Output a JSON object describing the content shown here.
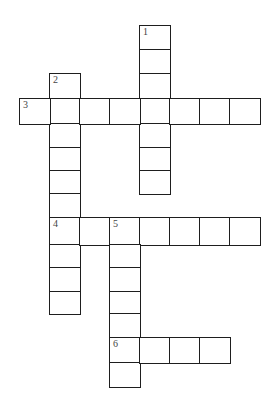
{
  "puzzle": {
    "type": "crossword",
    "cell_width": 30,
    "cell_height": 24,
    "origin_x": 19,
    "origin_y": 25,
    "col_x": [
      19,
      49,
      79,
      109,
      139,
      169,
      199,
      229
    ],
    "row_y": [
      25,
      49,
      73,
      98,
      123,
      147,
      170,
      193,
      217,
      244,
      267,
      291,
      313,
      337,
      362
    ],
    "line_color": "#1e1e1e",
    "background": "#ffffff",
    "entries": [
      {
        "number": "1",
        "direction": "down",
        "col": 4,
        "row": 0,
        "length": 7
      },
      {
        "number": "2",
        "direction": "down",
        "col": 1,
        "row": 2,
        "length": 10
      },
      {
        "number": "3",
        "direction": "across",
        "col": 0,
        "row": 3,
        "length": 8
      },
      {
        "number": "4",
        "direction": "across",
        "col": 1,
        "row": 8,
        "length": 7
      },
      {
        "number": "5",
        "direction": "down",
        "col": 3,
        "row": 8,
        "length": 7
      },
      {
        "number": "6",
        "direction": "across",
        "col": 3,
        "row": 13,
        "length": 4
      }
    ]
  }
}
